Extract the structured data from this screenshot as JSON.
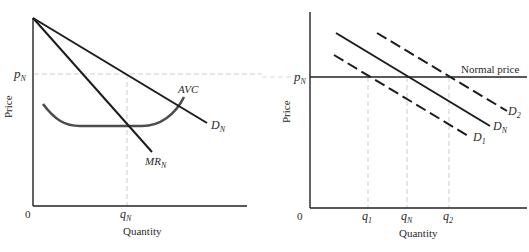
{
  "left_panel": {
    "y_axis_label": "Price",
    "x_axis_label": "Quantity",
    "origin_label": "0",
    "price_tick": {
      "main": "p",
      "sub": "N"
    },
    "quantity_tick": {
      "main": "q",
      "sub": "N"
    },
    "curves": {
      "demand": {
        "main": "D",
        "sub": "N"
      },
      "marginal_revenue": {
        "main": "MR",
        "sub": "N"
      },
      "avc": {
        "main": "AVC"
      }
    }
  },
  "right_panel": {
    "y_axis_label": "Price",
    "x_axis_label": "Quantity",
    "origin_label": "0",
    "price_tick": {
      "main": "p",
      "sub": "N"
    },
    "normal_price_label": "Normal price",
    "quantity_ticks": [
      {
        "main": "q",
        "sub": "1"
      },
      {
        "main": "q",
        "sub": "N"
      },
      {
        "main": "q",
        "sub": "2"
      }
    ],
    "curves": {
      "d2": {
        "main": "D",
        "sub": "2"
      },
      "dn": {
        "main": "D",
        "sub": "N"
      },
      "d1": {
        "main": "D",
        "sub": "1"
      }
    }
  },
  "colors": {
    "line": "#1c1c1c",
    "avc": "#4a4a4a",
    "dashed_guide": "#c8c8c8",
    "text": "#2a2a2a"
  }
}
